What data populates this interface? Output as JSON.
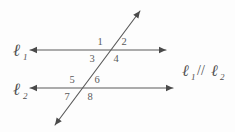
{
  "figure": {
    "background_color": "#fdfdfd",
    "stroke_color": "#5b5b5b",
    "text_color": "#4f4f4f"
  },
  "lines": [
    {
      "id": "l1",
      "label_base": "ℓ",
      "label_sub": "1",
      "label_full": "ℓ1",
      "y": 50,
      "x_start": 30,
      "x_end": 166,
      "arrow_left": true,
      "arrow_right": true
    },
    {
      "id": "l2",
      "label_base": "ℓ",
      "label_sub": "2",
      "label_full": "ℓ2",
      "y": 88,
      "x_start": 30,
      "x_end": 173,
      "arrow_left": true,
      "arrow_right": true
    }
  ],
  "transversal": {
    "id": "t",
    "x1": 55,
    "y1": 125,
    "x2": 140,
    "y2": 11,
    "arrow_top": true,
    "arrow_bottom": true
  },
  "intersections": [
    {
      "line": "l1",
      "x": 108,
      "y": 50
    },
    {
      "line": "l2",
      "x": 80,
      "y": 88
    }
  ],
  "angle_labels": [
    {
      "id": "angle-1",
      "text": "1",
      "x": 100,
      "y": 45,
      "at": "l1",
      "position": "upper-left"
    },
    {
      "id": "angle-2",
      "text": "2",
      "x": 124,
      "y": 45,
      "at": "l1",
      "position": "upper-right"
    },
    {
      "id": "angle-3",
      "text": "3",
      "x": 92,
      "y": 62,
      "at": "l1",
      "position": "lower-left"
    },
    {
      "id": "angle-4",
      "text": "4",
      "x": 116,
      "y": 62,
      "at": "l1",
      "position": "lower-right"
    },
    {
      "id": "angle-5",
      "text": "5",
      "x": 72,
      "y": 83,
      "at": "l2",
      "position": "upper-left"
    },
    {
      "id": "angle-6",
      "text": "6",
      "x": 97,
      "y": 83,
      "at": "l2",
      "position": "upper-right"
    },
    {
      "id": "angle-7",
      "text": "7",
      "x": 67,
      "y": 100,
      "at": "l2",
      "position": "lower-left"
    },
    {
      "id": "angle-8",
      "text": "8",
      "x": 90,
      "y": 100,
      "at": "l2",
      "position": "lower-right"
    }
  ],
  "line_name_labels": [
    {
      "id": "label-l1",
      "base": "ℓ",
      "sub": "1",
      "x": 14,
      "y": 56
    },
    {
      "id": "label-l2",
      "base": "ℓ",
      "sub": "2",
      "x": 14,
      "y": 95
    }
  ],
  "relation_note": {
    "id": "parallel-relation",
    "left_base": "ℓ",
    "left_sub": "1",
    "operator": "//",
    "right_base": "ℓ",
    "right_sub": "2",
    "full_text": "ℓ1 // ℓ2",
    "meaning": "line 1 is parallel to line 2",
    "x": 183,
    "y": 76
  }
}
